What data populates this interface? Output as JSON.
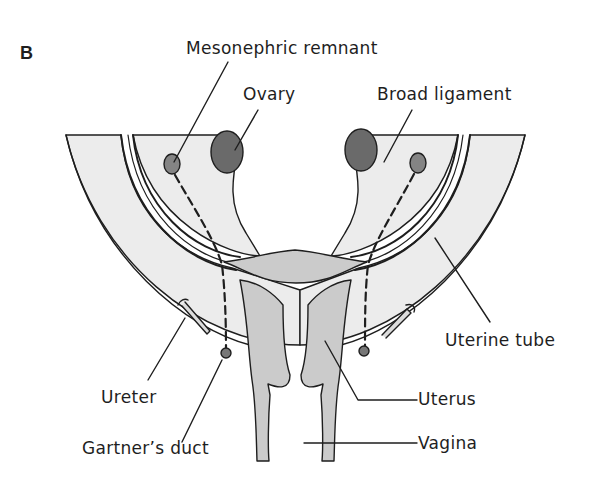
{
  "figure": {
    "panel_label": "B",
    "colors": {
      "background": "#ffffff",
      "ligament_fill": "#ececec",
      "uterus_fill": "#cbcbcb",
      "ovary_fill": "#6a6a6a",
      "remnant_fill": "#848484",
      "outline": "#1e1e1e"
    }
  },
  "labels": {
    "mesonephric_remnant": "Mesonephric  remnant",
    "ovary": "Ovary",
    "broad_ligament": "Broad ligament",
    "uterine_tube": "Uterine tube",
    "ureter": "Ureter",
    "uterus": "Uterus",
    "gartners_duct": "Gartner’s duct",
    "vagina": "Vagina"
  }
}
